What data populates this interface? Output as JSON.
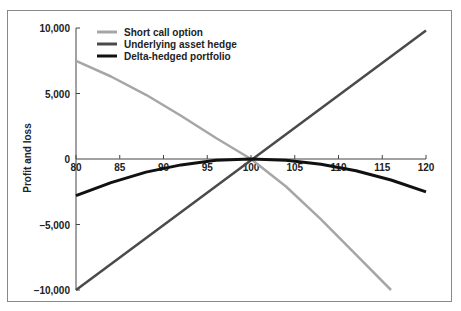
{
  "chart_data": {
    "type": "line",
    "title": "",
    "xlabel": "",
    "ylabel": "Profit and loss",
    "xlim": [
      80,
      120
    ],
    "ylim": [
      -10000,
      10000
    ],
    "x_ticks": [
      "80",
      "85",
      "90",
      "95",
      "100",
      "105",
      "110",
      "115",
      "120"
    ],
    "y_ticks": [
      "10,000",
      "5,000",
      "0",
      "–5,000",
      "–10,000"
    ],
    "grid": false,
    "legend_position": "top-left",
    "series": [
      {
        "name": "Short call option",
        "color": "#a6a6a6",
        "x": [
          80,
          84,
          88,
          92,
          96,
          100,
          104,
          108,
          112,
          116
        ],
        "y": [
          7500,
          6300,
          4900,
          3300,
          1600,
          0,
          -2100,
          -4600,
          -7300,
          -10000
        ]
      },
      {
        "name": "Underlying asset hedge",
        "color": "#4a4a4a",
        "x": [
          80,
          120
        ],
        "y": [
          -10000,
          9800
        ]
      },
      {
        "name": "Delta-hedged portfolio",
        "color": "#111111",
        "x": [
          80,
          84,
          88,
          92,
          96,
          100,
          104,
          108,
          112,
          116,
          120
        ],
        "y": [
          -2800,
          -1800,
          -1000,
          -450,
          -100,
          0,
          -100,
          -400,
          -900,
          -1600,
          -2500
        ]
      }
    ]
  },
  "legend": {
    "items": [
      {
        "label": "Short call option",
        "color": "#a6a6a6"
      },
      {
        "label": "Underlying asset hedge",
        "color": "#4a4a4a"
      },
      {
        "label": "Delta-hedged portfolio",
        "color": "#111111"
      }
    ]
  }
}
